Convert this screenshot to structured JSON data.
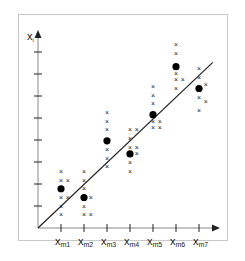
{
  "chart_data": {
    "type": "scatter",
    "title": "",
    "xlabel": "",
    "ylabel": "x_i",
    "y_axis_label_main": "x",
    "y_axis_label_sub": "i",
    "categories": [
      "x_m1",
      "x_m2",
      "x_m3",
      "x_m4",
      "x_m5",
      "x_m6",
      "x_m7"
    ],
    "tick_labels": [
      {
        "main": "x",
        "sub": "m1"
      },
      {
        "main": "x",
        "sub": "m2"
      },
      {
        "main": "x",
        "sub": "m3"
      },
      {
        "main": "x",
        "sub": "m4"
      },
      {
        "main": "x",
        "sub": "m5"
      },
      {
        "main": "x",
        "sub": "m6"
      },
      {
        "main": "x",
        "sub": "m7"
      }
    ],
    "y_ticks": 8,
    "grid": false,
    "legend": null,
    "regression_line": {
      "x0": 0,
      "y0": 0,
      "x1": 7.6,
      "y1": 7.6
    },
    "means": [
      {
        "x": 1,
        "y": 1.8
      },
      {
        "x": 2,
        "y": 1.4
      },
      {
        "x": 3,
        "y": 4.0
      },
      {
        "x": 4,
        "y": 3.4
      },
      {
        "x": 5,
        "y": 5.2
      },
      {
        "x": 6,
        "y": 7.4
      },
      {
        "x": 7,
        "y": 6.4
      }
    ],
    "observations": [
      {
        "x": 1,
        "y": 2.6
      },
      {
        "x": 1,
        "y": 2.2
      },
      {
        "x": 1.3,
        "y": 2.2
      },
      {
        "x": 1,
        "y": 1.4
      },
      {
        "x": 1.3,
        "y": 1.4
      },
      {
        "x": 1,
        "y": 1.0
      },
      {
        "x": 1,
        "y": 0.6
      },
      {
        "x": 2,
        "y": 2.6
      },
      {
        "x": 2,
        "y": 2.2
      },
      {
        "x": 2,
        "y": 1.8
      },
      {
        "x": 2.3,
        "y": 1.4
      },
      {
        "x": 2,
        "y": 1.0
      },
      {
        "x": 2,
        "y": 0.6
      },
      {
        "x": 2.3,
        "y": 0.6
      },
      {
        "x": 3,
        "y": 5.3
      },
      {
        "x": 3,
        "y": 4.9
      },
      {
        "x": 3,
        "y": 4.5
      },
      {
        "x": 3,
        "y": 3.6
      },
      {
        "x": 3,
        "y": 3.2
      },
      {
        "x": 3,
        "y": 2.8
      },
      {
        "x": 4,
        "y": 4.5
      },
      {
        "x": 4.3,
        "y": 4.5
      },
      {
        "x": 4,
        "y": 4.1
      },
      {
        "x": 4,
        "y": 3.7
      },
      {
        "x": 4.3,
        "y": 3.7
      },
      {
        "x": 4.3,
        "y": 3.4
      },
      {
        "x": 4,
        "y": 3.0
      },
      {
        "x": 4,
        "y": 2.6
      },
      {
        "x": 5,
        "y": 6.5
      },
      {
        "x": 5,
        "y": 6.1
      },
      {
        "x": 5,
        "y": 5.7
      },
      {
        "x": 5,
        "y": 4.9
      },
      {
        "x": 5.3,
        "y": 4.9
      },
      {
        "x": 5,
        "y": 4.6
      },
      {
        "x": 5.3,
        "y": 4.6
      },
      {
        "x": 6,
        "y": 8.4
      },
      {
        "x": 6,
        "y": 8.0
      },
      {
        "x": 6,
        "y": 7.1
      },
      {
        "x": 6.3,
        "y": 6.8
      },
      {
        "x": 6,
        "y": 6.8
      },
      {
        "x": 6,
        "y": 6.4
      },
      {
        "x": 7,
        "y": 7.3
      },
      {
        "x": 7,
        "y": 6.9
      },
      {
        "x": 7.3,
        "y": 6.6
      },
      {
        "x": 7,
        "y": 6.0
      },
      {
        "x": 7.3,
        "y": 5.8
      },
      {
        "x": 7,
        "y": 5.4
      }
    ],
    "colors": {
      "axis": "#222222",
      "line": "#222222",
      "mean": "#000000",
      "cross": "#555555",
      "frame": "#c8c8c8"
    }
  }
}
